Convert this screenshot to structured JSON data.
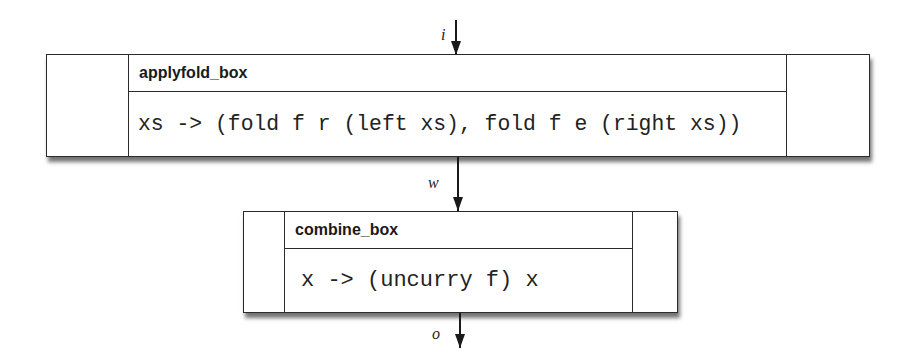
{
  "diagram": {
    "boxes": [
      {
        "title": "applyfold_box",
        "code": "xs -> (fold f r (left xs), fold f e (right xs))"
      },
      {
        "title": "combine_box",
        "code": "x -> (uncurry f) x"
      }
    ],
    "arrows": [
      {
        "label": "i"
      },
      {
        "label": "w"
      },
      {
        "label": "o"
      }
    ]
  }
}
